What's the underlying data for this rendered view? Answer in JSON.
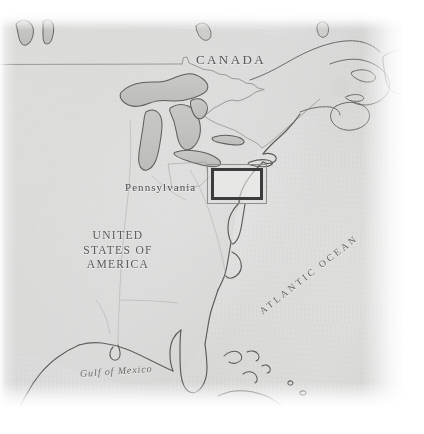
{
  "map": {
    "kind": "vintage-reference-map",
    "region": "Eastern North America",
    "colors": {
      "paper": "#dadad9",
      "land_outline": "#6f6f6d",
      "lake_fill": "#c3c3c2",
      "lake_outline": "#5a5a58",
      "border_line": "#8b8b89",
      "label_text": "#5a5a5a",
      "highlight_inner": "#3c3c3c",
      "highlight_outer": "#8e8e8c"
    },
    "labels": {
      "canada": "CANADA",
      "pennsylvania": "Pennsylvania",
      "united_states_line1": "UNITED",
      "united_states_line2": "STATES OF",
      "united_states_line3": "AMERICA",
      "gulf_of_mexico": "Gulf of Mexico",
      "atlantic_ocean": "ATLANTIC OCEAN"
    },
    "highlight": {
      "name": "inset-detail-rectangle",
      "x": 207,
      "y": 164,
      "width": 60,
      "height": 40
    }
  }
}
